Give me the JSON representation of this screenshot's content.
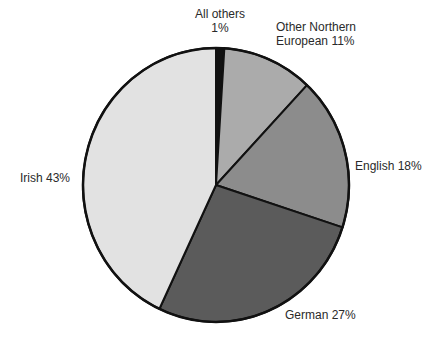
{
  "chart_data": {
    "type": "pie",
    "title": "",
    "start_angle_deg": -90,
    "direction": "clockwise",
    "slices": [
      {
        "label": "All others",
        "value": 1,
        "display": "All others\n1%",
        "color": "#111111"
      },
      {
        "label": "Other Northern European",
        "value": 11,
        "display": "Other Northern European 11%",
        "color": "#ababab"
      },
      {
        "label": "English",
        "value": 18,
        "display": "English 18%",
        "color": "#8c8c8c"
      },
      {
        "label": "German",
        "value": 27,
        "display": "German 27%",
        "color": "#5b5b5b"
      },
      {
        "label": "Irish",
        "value": 43,
        "display": "Irish 43%",
        "color": "#e2e2e2"
      }
    ],
    "categories": [
      "All others",
      "Other Northern European",
      "English",
      "German",
      "Irish"
    ],
    "values": [
      1,
      11,
      18,
      27,
      43
    ],
    "unit": "%"
  },
  "labels": {
    "all_others_line1": "All others",
    "all_others_line2": "1%",
    "other_ne_line1": "Other Northern",
    "other_ne_line2": "European 11%",
    "english": "English 18%",
    "german": "German 27%",
    "irish": "Irish 43%"
  },
  "geometry": {
    "cx": 216,
    "cy": 185,
    "rx": 133,
    "ry": 137
  }
}
